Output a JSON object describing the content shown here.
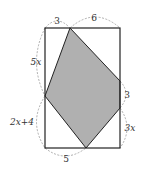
{
  "diagram": {
    "colors": {
      "background": "#ffffff",
      "outline": "#222222",
      "shade": "#b0b0b0",
      "dashed_arc": "#999999",
      "label": "#333333"
    },
    "rectangle": {
      "x1": 45,
      "y1": 28,
      "x2": 120,
      "y2": 148
    },
    "shaded_polygon": [
      [
        70,
        28
      ],
      [
        120,
        81
      ],
      [
        120,
        108
      ],
      [
        86,
        148
      ],
      [
        45,
        96
      ]
    ],
    "labels": {
      "top_left": "3",
      "top_right": "6",
      "left_upper": "5x",
      "left_lower": "2x+4",
      "right_middle": "3",
      "right_lower": "3x",
      "bottom_left": "5"
    }
  }
}
